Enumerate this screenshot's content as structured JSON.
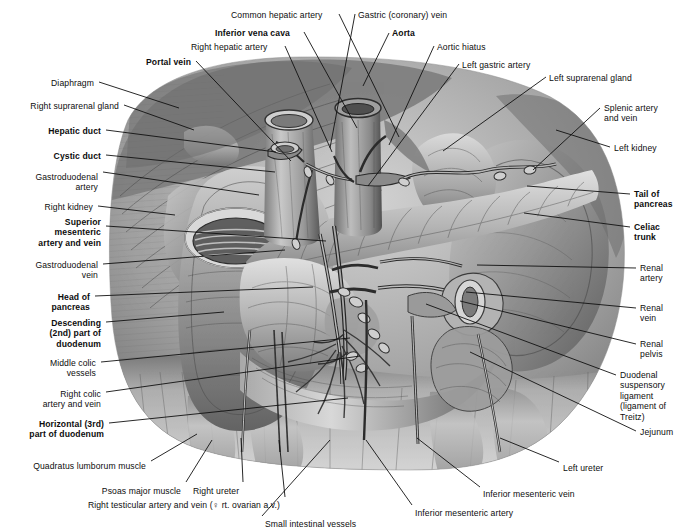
{
  "plate": {
    "width": 681,
    "height": 531,
    "background": "#ffffff",
    "ink": "#0d0d0d",
    "leader_color": "#111111",
    "title": "Pancreas, duodenum and retroperitoneal vessels"
  },
  "labels": [
    {
      "id": "common-hepatic-artery",
      "text": "Common hepatic artery",
      "x": 231,
      "y": 10,
      "align": "left",
      "bold": false
    },
    {
      "id": "gastric-coronary-vein",
      "text": "Gastric (coronary) vein",
      "x": 358,
      "y": 10,
      "align": "left",
      "bold": false
    },
    {
      "id": "inferior-vena-cava",
      "text": "Inferior vena cava",
      "x": 215,
      "y": 28,
      "align": "left",
      "bold": true
    },
    {
      "id": "aorta",
      "text": "Aorta",
      "x": 392,
      "y": 28,
      "align": "left",
      "bold": true
    },
    {
      "id": "right-hepatic-artery",
      "text": "Right hepatic artery",
      "x": 191,
      "y": 42,
      "align": "left",
      "bold": false
    },
    {
      "id": "aortic-hiatus",
      "text": "Aortic hiatus",
      "x": 437,
      "y": 42,
      "align": "left",
      "bold": false
    },
    {
      "id": "portal-vein",
      "text": "Portal vein",
      "x": 146,
      "y": 57,
      "align": "left",
      "bold": true
    },
    {
      "id": "left-gastric-artery",
      "text": "Left gastric artery",
      "x": 462,
      "y": 60,
      "align": "left",
      "bold": false
    },
    {
      "id": "left-suprarenal-gland",
      "text": "Left suprarenal gland",
      "x": 549,
      "y": 73,
      "align": "left",
      "bold": false
    },
    {
      "id": "diaphragm",
      "text": "Diaphragm",
      "x": 94,
      "y": 78,
      "align": "right",
      "bold": false
    },
    {
      "id": "right-suprarenal-gland",
      "text": "Right suprarenal gland",
      "x": 119,
      "y": 101,
      "align": "right",
      "bold": false
    },
    {
      "id": "splenic-artery-and-vein",
      "text": "Splenic artery\nand vein",
      "x": 604,
      "y": 103,
      "align": "left",
      "bold": false
    },
    {
      "id": "hepatic-duct",
      "text": "Hepatic duct",
      "x": 101,
      "y": 126,
      "align": "right",
      "bold": true
    },
    {
      "id": "left-kidney",
      "text": "Left kidney",
      "x": 614,
      "y": 143,
      "align": "left",
      "bold": false
    },
    {
      "id": "cystic-duct",
      "text": "Cystic duct",
      "x": 101,
      "y": 151,
      "align": "right",
      "bold": true
    },
    {
      "id": "gastroduodenal-artery",
      "text": "Gastroduodenal\nartery",
      "x": 98,
      "y": 172,
      "align": "right",
      "bold": false
    },
    {
      "id": "tail-of-pancreas",
      "text": "Tail of\npancreas",
      "x": 634,
      "y": 189,
      "align": "left",
      "bold": true
    },
    {
      "id": "right-kidney",
      "text": "Right kidney",
      "x": 93,
      "y": 202,
      "align": "right",
      "bold": false
    },
    {
      "id": "superior-mesenteric-artery-and-vein",
      "text": "Superior\nmesenteric\nartery and vein",
      "x": 101,
      "y": 217,
      "align": "right",
      "bold": true
    },
    {
      "id": "celiac-trunk",
      "text": "Celiac\ntrunk",
      "x": 634,
      "y": 222,
      "align": "left",
      "bold": true
    },
    {
      "id": "gastroduodenal-vein",
      "text": "Gastroduodenal\nvein",
      "x": 98,
      "y": 260,
      "align": "right",
      "bold": false
    },
    {
      "id": "renal-artery",
      "text": "Renal\nartery",
      "x": 640,
      "y": 263,
      "align": "left",
      "bold": false
    },
    {
      "id": "head-of-pancreas",
      "text": "Head of\npancreas",
      "x": 90,
      "y": 292,
      "align": "right",
      "bold": true
    },
    {
      "id": "renal-vein",
      "text": "Renal\nvein",
      "x": 640,
      "y": 303,
      "align": "left",
      "bold": false
    },
    {
      "id": "descending-2nd-part-of-duodenum",
      "text": "Descending\n(2nd) part of\nduodenum",
      "x": 101,
      "y": 318,
      "align": "right",
      "bold": true
    },
    {
      "id": "renal-pelvis",
      "text": "Renal\npelvis",
      "x": 640,
      "y": 339,
      "align": "left",
      "bold": false
    },
    {
      "id": "middle-colic-vessels",
      "text": "Middle colic\nvessels",
      "x": 96,
      "y": 358,
      "align": "right",
      "bold": false
    },
    {
      "id": "duodenal-suspensory-ligament",
      "text": "Duodenal\nsuspensory\nligament\n(ligament of\nTreitz)",
      "x": 620,
      "y": 370,
      "align": "left",
      "bold": false
    },
    {
      "id": "right-colic-artery-and-vein",
      "text": "Right colic\nartery and vein",
      "x": 101,
      "y": 389,
      "align": "right",
      "bold": false
    },
    {
      "id": "jejunum",
      "text": "Jejunum",
      "x": 640,
      "y": 427,
      "align": "left",
      "bold": false
    },
    {
      "id": "horizontal-3rd-part-of-duodenum",
      "text": "Horizontal (3rd)\npart of duodenum",
      "x": 104,
      "y": 419,
      "align": "right",
      "bold": true
    },
    {
      "id": "left-ureter",
      "text": "Left ureter",
      "x": 563,
      "y": 463,
      "align": "left",
      "bold": false
    },
    {
      "id": "quadratus-lumborum-muscle",
      "text": "Quadratus lumborum muscle",
      "x": 146,
      "y": 461,
      "align": "right",
      "bold": false
    },
    {
      "id": "psoas-major-muscle",
      "text": "Psoas major muscle",
      "x": 181,
      "y": 486,
      "align": "right",
      "bold": false
    },
    {
      "id": "right-ureter",
      "text": "Right ureter",
      "x": 193,
      "y": 486,
      "align": "left",
      "bold": false
    },
    {
      "id": "inferior-mesenteric-vein",
      "text": "Inferior mesenteric vein",
      "x": 483,
      "y": 489,
      "align": "left",
      "bold": false
    },
    {
      "id": "right-testicular-artery-and-vein",
      "text": "Right testicular artery and vein (♀ rt. ovarian a.v.)",
      "x": 280,
      "y": 500,
      "align": "right",
      "bold": false
    },
    {
      "id": "inferior-mesenteric-artery",
      "text": "Inferior mesenteric artery",
      "x": 415,
      "y": 508,
      "align": "left",
      "bold": false
    },
    {
      "id": "small-intestinal-vessels",
      "text": "Small intestinal vessels",
      "x": 265,
      "y": 519,
      "align": "left",
      "bold": false
    }
  ],
  "leaders": [
    {
      "id": "lead-common-hepatic-artery",
      "x1": 339,
      "y1": 14,
      "x2": 399,
      "y2": 137
    },
    {
      "id": "lead-gastric-coronary-vein",
      "x1": 355,
      "y1": 14,
      "x2": 330,
      "y2": 148
    },
    {
      "id": "lead-inferior-vena-cava",
      "x1": 304,
      "y1": 32,
      "x2": 357,
      "y2": 128
    },
    {
      "id": "lead-aorta",
      "x1": 389,
      "y1": 33,
      "x2": 363,
      "y2": 86
    },
    {
      "id": "lead-right-hepatic-artery",
      "x1": 285,
      "y1": 46,
      "x2": 332,
      "y2": 152
    },
    {
      "id": "lead-aortic-hiatus",
      "x1": 434,
      "y1": 46,
      "x2": 389,
      "y2": 145
    },
    {
      "id": "lead-portal-vein",
      "x1": 196,
      "y1": 61,
      "x2": 291,
      "y2": 161
    },
    {
      "id": "lead-left-gastric-artery",
      "x1": 459,
      "y1": 64,
      "x2": 368,
      "y2": 186
    },
    {
      "id": "lead-left-suprarenal-gland",
      "x1": 546,
      "y1": 77,
      "x2": 443,
      "y2": 151
    },
    {
      "id": "lead-diaphragm",
      "x1": 99,
      "y1": 82,
      "x2": 179,
      "y2": 108
    },
    {
      "id": "lead-right-suprarenal-gland",
      "x1": 124,
      "y1": 105,
      "x2": 194,
      "y2": 130
    },
    {
      "id": "lead-splenic-artery-and-vein",
      "x1": 600,
      "y1": 108,
      "x2": 533,
      "y2": 170
    },
    {
      "id": "lead-hepatic-duct",
      "x1": 106,
      "y1": 130,
      "x2": 276,
      "y2": 152
    },
    {
      "id": "lead-left-kidney",
      "x1": 610,
      "y1": 147,
      "x2": 556,
      "y2": 130
    },
    {
      "id": "lead-cystic-duct",
      "x1": 106,
      "y1": 155,
      "x2": 275,
      "y2": 172
    },
    {
      "id": "lead-gastroduodenal-artery",
      "x1": 103,
      "y1": 172,
      "x2": 259,
      "y2": 195
    },
    {
      "id": "lead-tail-of-pancreas",
      "x1": 630,
      "y1": 194,
      "x2": 527,
      "y2": 186
    },
    {
      "id": "lead-right-kidney",
      "x1": 98,
      "y1": 206,
      "x2": 175,
      "y2": 215
    },
    {
      "id": "lead-superior-mesenteric",
      "x1": 106,
      "y1": 226,
      "x2": 326,
      "y2": 241
    },
    {
      "id": "lead-celiac-trunk",
      "x1": 630,
      "y1": 227,
      "x2": 524,
      "y2": 213
    },
    {
      "id": "lead-gastroduodenal-vein",
      "x1": 103,
      "y1": 264,
      "x2": 285,
      "y2": 250
    },
    {
      "id": "lead-renal-artery",
      "x1": 636,
      "y1": 268,
      "x2": 477,
      "y2": 265
    },
    {
      "id": "lead-head-of-pancreas",
      "x1": 95,
      "y1": 296,
      "x2": 313,
      "y2": 287
    },
    {
      "id": "lead-renal-vein",
      "x1": 636,
      "y1": 308,
      "x2": 466,
      "y2": 292
    },
    {
      "id": "lead-descending-duodenum",
      "x1": 106,
      "y1": 322,
      "x2": 224,
      "y2": 312
    },
    {
      "id": "lead-renal-pelvis",
      "x1": 636,
      "y1": 344,
      "x2": 460,
      "y2": 301
    },
    {
      "id": "lead-middle-colic-vessels",
      "x1": 101,
      "y1": 362,
      "x2": 350,
      "y2": 338
    },
    {
      "id": "lead-duodenal-suspensory",
      "x1": 616,
      "y1": 375,
      "x2": 426,
      "y2": 304
    },
    {
      "id": "lead-right-colic",
      "x1": 106,
      "y1": 392,
      "x2": 360,
      "y2": 356
    },
    {
      "id": "lead-jejunum",
      "x1": 636,
      "y1": 431,
      "x2": 470,
      "y2": 352
    },
    {
      "id": "lead-horizontal-duodenum",
      "x1": 109,
      "y1": 423,
      "x2": 348,
      "y2": 398
    },
    {
      "id": "lead-left-ureter",
      "x1": 559,
      "y1": 462,
      "x2": 500,
      "y2": 438
    },
    {
      "id": "lead-quadratus-lumborum",
      "x1": 151,
      "y1": 461,
      "x2": 197,
      "y2": 434
    },
    {
      "id": "lead-psoas-major",
      "x1": 186,
      "y1": 482,
      "x2": 212,
      "y2": 440
    },
    {
      "id": "lead-right-ureter",
      "x1": 243,
      "y1": 482,
      "x2": 241,
      "y2": 438
    },
    {
      "id": "lead-inferior-mesenteric-vein",
      "x1": 480,
      "y1": 487,
      "x2": 417,
      "y2": 438
    },
    {
      "id": "lead-right-testicular",
      "x1": 285,
      "y1": 497,
      "x2": 279,
      "y2": 440
    },
    {
      "id": "lead-inferior-mesenteric-artery",
      "x1": 412,
      "y1": 505,
      "x2": 366,
      "y2": 440
    },
    {
      "id": "lead-small-intestinal-vessels",
      "x1": 262,
      "y1": 516,
      "x2": 330,
      "y2": 440
    }
  ]
}
